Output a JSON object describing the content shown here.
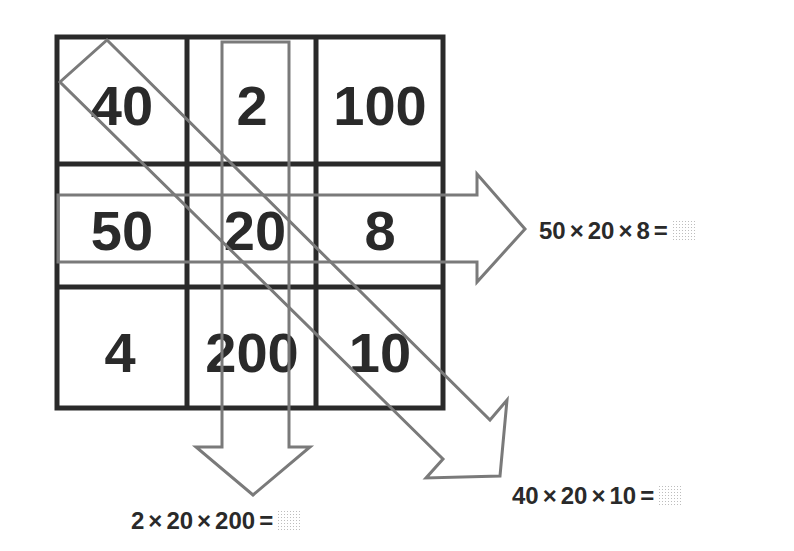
{
  "grid": {
    "rows": [
      [
        "40",
        "2",
        "100"
      ],
      [
        "50",
        "20",
        "8"
      ],
      [
        "4",
        "200",
        "10"
      ]
    ]
  },
  "arrows": [
    {
      "id": "row",
      "direction": "right",
      "covers": [
        "50",
        "20",
        "8"
      ]
    },
    {
      "id": "column",
      "direction": "down",
      "covers": [
        "2",
        "20",
        "200"
      ]
    },
    {
      "id": "diagonal",
      "direction": "down-right",
      "covers": [
        "40",
        "20",
        "10"
      ]
    }
  ],
  "equations": {
    "row": {
      "a": "50",
      "b": "20",
      "c": "8",
      "times": "×",
      "equals": "=",
      "answer": ""
    },
    "column": {
      "a": "2",
      "b": "20",
      "c": "200",
      "times": "×",
      "equals": "=",
      "answer": ""
    },
    "diagonal": {
      "a": "40",
      "b": "20",
      "c": "10",
      "times": "×",
      "equals": "=",
      "answer": ""
    }
  },
  "colors": {
    "grid_line": "#2a2a2a",
    "arrow_outline": "#7a7a7a",
    "text": "#2a2a2a"
  }
}
